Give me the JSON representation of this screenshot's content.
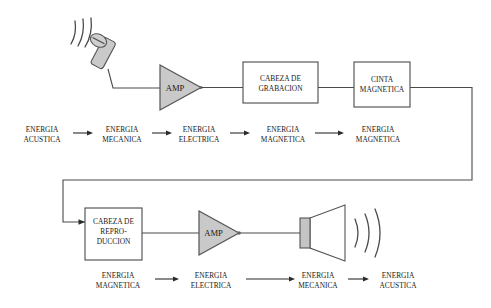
{
  "diagram": {
    "background_color": "#ffffff",
    "line_color": "#4a4a4a",
    "fill_gray": "#c9c9c9",
    "text_color": "#1a1a1a"
  },
  "record_chain": {
    "microphone": {
      "name": "microfono",
      "waves": "sound-waves"
    },
    "amp": {
      "label": "AMP"
    },
    "record_head": {
      "line1": "CABEZA DE",
      "line2": "GRABACION"
    },
    "tape": {
      "line1": "CINTA",
      "line2": "MAGNETICA"
    }
  },
  "playback_chain": {
    "playback_head": {
      "line1": "CABEZA DE",
      "line2": "REPRO-",
      "line3": "DUCCION"
    },
    "amp": {
      "label": "AMP"
    },
    "speaker": {
      "name": "altavoz",
      "waves": "sound-waves"
    }
  },
  "energy_row_top": {
    "items": [
      {
        "line1": "ENERGIA",
        "line2": "ACUSTICA"
      },
      {
        "line1": "ENERGIA",
        "line2": "MECANICA"
      },
      {
        "line1": "ENERGIA",
        "line2": "ELECTRICA"
      },
      {
        "line1": "ENERGIA",
        "line2": "MAGNETICA"
      },
      {
        "line1": "ENERGIA",
        "line2": "MAGNETICA"
      }
    ]
  },
  "energy_row_bottom": {
    "items": [
      {
        "line1": "ENERGIA",
        "line2": "MAGNETICA"
      },
      {
        "line1": "ENERGIA",
        "line2": "ELECTRICA"
      },
      {
        "line1": "ENERGIA",
        "line2": "MECANICA"
      },
      {
        "line1": "ENERGIA",
        "line2": "ACUSTICA"
      }
    ]
  }
}
